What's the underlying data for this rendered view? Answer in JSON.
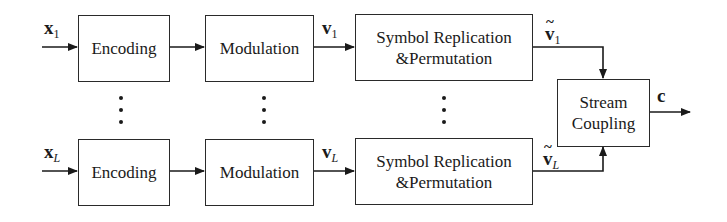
{
  "diagram": {
    "rows": [
      {
        "input_label": "x",
        "input_sub": "1",
        "encoding_label": "Encoding",
        "modulation_label": "Modulation",
        "mod_out_label": "v",
        "mod_out_sub": "1",
        "replication_label_line1": "Symbol Replication",
        "replication_label_line2": "&Permutation",
        "rep_out_label": "v",
        "rep_out_sub": "1"
      },
      {
        "input_label": "x",
        "input_sub": "L",
        "encoding_label": "Encoding",
        "modulation_label": "Modulation",
        "mod_out_label": "v",
        "mod_out_sub": "L",
        "replication_label_line1": "Symbol Replication",
        "replication_label_line2": "&Permutation",
        "rep_out_label": "v",
        "rep_out_sub": "L"
      }
    ],
    "coupling_label_line1": "Stream",
    "coupling_label_line2": "Coupling",
    "output_label": "c",
    "ellipsis": "⋮"
  }
}
